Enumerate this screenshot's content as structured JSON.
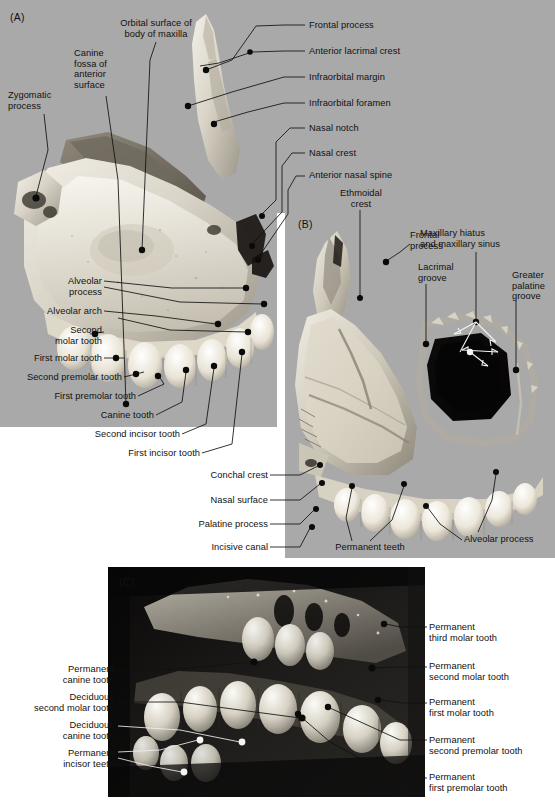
{
  "figure": {
    "background_color": "#ffffff",
    "panel_background": "#a9a9a9",
    "panel_c_background": "#0c0c0c"
  },
  "panels": [
    {
      "id": "A",
      "letter": "(A)",
      "view": "lateral / anterior surface of maxilla"
    },
    {
      "id": "B",
      "letter": "(B)",
      "view": "medial / nasal surface of maxilla"
    },
    {
      "id": "C",
      "letter": "(C)",
      "view": "child maxilla with deciduous and permanent teeth"
    }
  ],
  "panelA": {
    "letter": "(A)",
    "labels_top_left": [
      {
        "name": "orbital-surface-of-body-of-maxilla",
        "text": "Orbital surface of\nbody of maxilla"
      },
      {
        "name": "canine-fossa-of-anterior-surface",
        "text": "Canine\nfossa of\nanterior\nsurface"
      },
      {
        "name": "zygomatic-process",
        "text": "Zygomatic\nprocess"
      }
    ],
    "labels_right": [
      {
        "name": "frontal-process",
        "text": "Frontal process"
      },
      {
        "name": "anterior-lacrimal-crest",
        "text": "Anterior lacrimal crest"
      },
      {
        "name": "infraorbital-margin",
        "text": "Infraorbital margin"
      },
      {
        "name": "infraorbital-foramen",
        "text": "Infraorbital foramen"
      },
      {
        "name": "nasal-notch",
        "text": "Nasal notch"
      },
      {
        "name": "nasal-crest",
        "text": "Nasal crest"
      },
      {
        "name": "anterior-nasal-spine",
        "text": "Anterior nasal spine"
      }
    ],
    "labels_left_lower": [
      {
        "name": "alveolar-process",
        "text": "Alveolar\nprocess"
      },
      {
        "name": "alveolar-arch",
        "text": "Alveolar arch"
      },
      {
        "name": "second-molar-tooth",
        "text": "Second\nmolar tooth"
      },
      {
        "name": "first-molar-tooth",
        "text": "First molar tooth"
      },
      {
        "name": "second-premolar-tooth",
        "text": "Second premolar tooth"
      },
      {
        "name": "first-premolar-tooth",
        "text": "First premolar tooth"
      },
      {
        "name": "canine-tooth",
        "text": "Canine tooth"
      },
      {
        "name": "second-incisor-tooth",
        "text": "Second incisor tooth"
      },
      {
        "name": "first-incisor-tooth",
        "text": "First incisor tooth"
      }
    ]
  },
  "interpanel": {
    "ethmoidal_crest": {
      "name": "ethmoidal-crest",
      "text": "Ethmoidal\ncrest"
    }
  },
  "panelB": {
    "letter": "(B)",
    "labels_top": [
      {
        "name": "frontal-process",
        "text": "Frontal\nprocess"
      },
      {
        "name": "lacrimal-groove",
        "text": "Lacrimal\ngroove"
      },
      {
        "name": "maxillary-hiatus-and-maxillary-sinus",
        "text": "Maxillary hiatus\nand maxillary sinus"
      },
      {
        "name": "greater-palatine-groove",
        "text": "Greater\npalatine\ngroove"
      }
    ],
    "labels_left": [
      {
        "name": "conchal-crest",
        "text": "Conchal crest"
      },
      {
        "name": "nasal-surface",
        "text": "Nasal surface"
      },
      {
        "name": "palatine-process",
        "text": "Palatine process"
      },
      {
        "name": "incisive-canal",
        "text": "Incisive canal"
      }
    ],
    "labels_bottom": [
      {
        "name": "permanent-teeth",
        "text": "Permanent teeth"
      },
      {
        "name": "alveolar-process",
        "text": "Alveolar process"
      }
    ]
  },
  "panelC": {
    "letter": "(C)",
    "labels_left": [
      {
        "name": "permanent-canine-tooth",
        "text": "Permanent\ncanine tooth"
      },
      {
        "name": "deciduous-second-molar-tooth",
        "text": "Deciduous\nsecond molar tooth"
      },
      {
        "name": "deciduous-canine-tooth",
        "text": "Deciduous\ncanine tooth"
      },
      {
        "name": "permanent-incisor-teeth",
        "text": "Permanent\nincisor teeth"
      }
    ],
    "labels_right": [
      {
        "name": "permanent-third-molar-tooth",
        "text": "Permanent\nthird molar tooth"
      },
      {
        "name": "permanent-second-molar-tooth",
        "text": "Permanent\nsecond molar tooth"
      },
      {
        "name": "permanent-first-molar-tooth",
        "text": "Permanent\nfirst molar tooth"
      },
      {
        "name": "permanent-second-premolar-tooth",
        "text": "Permanent\nsecond premolar tooth"
      },
      {
        "name": "permanent-first-premolar-tooth",
        "text": "Permanent\nfirst premolar tooth"
      }
    ]
  }
}
